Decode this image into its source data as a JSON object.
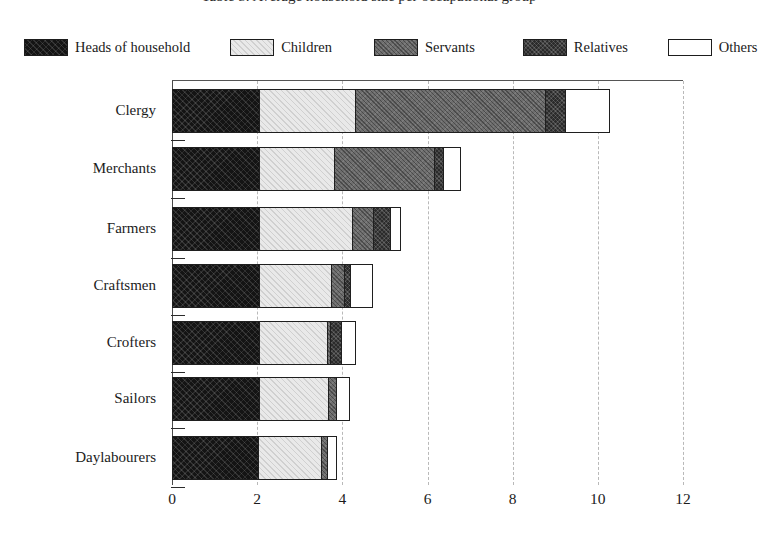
{
  "title": {
    "text": "Table 5. Average household size per occupational group",
    "clipped": true
  },
  "legend": {
    "position": "top",
    "items": [
      {
        "label": "Heads of household",
        "icon": "legend-swatch-black-hatched",
        "fill": "#141414"
      },
      {
        "label": "Children",
        "icon": "legend-swatch-light-hatched",
        "fill": "#e9e9e9"
      },
      {
        "label": "Servants",
        "icon": "legend-swatch-gray-hatched",
        "fill": "#6e6e6e"
      },
      {
        "label": "Relatives",
        "icon": "legend-swatch-dark-hatched",
        "fill": "#2b2b2b"
      },
      {
        "label": "Others",
        "icon": "legend-swatch-white-outline",
        "fill": "#ffffff"
      }
    ]
  },
  "axes": {
    "x": {
      "ticks": [
        "0",
        "2",
        "4",
        "6",
        "8",
        "10",
        "12"
      ],
      "min": 0,
      "max": 12,
      "label": "",
      "grid": true
    },
    "y": {
      "label": "",
      "categories": [
        "Clergy",
        "Merchants",
        "Farmers",
        "Craftsmen",
        "Crofters",
        "Sailors",
        "Daylabourers"
      ]
    }
  },
  "chart_data": {
    "type": "bar",
    "orientation": "horizontal",
    "stacked": true,
    "title": "Table 5. Average household size per occupational group",
    "xlabel": "",
    "ylabel": "",
    "xlim": [
      0,
      12
    ],
    "xticks": [
      0,
      2,
      4,
      6,
      8,
      10,
      12
    ],
    "grid": true,
    "legend_position": "top",
    "categories": [
      "Clergy",
      "Merchants",
      "Farmers",
      "Craftsmen",
      "Crofters",
      "Sailors",
      "Daylabourers"
    ],
    "series": [
      {
        "name": "Heads of household",
        "values": [
          2.05,
          2.05,
          2.05,
          2.05,
          2.05,
          2.05,
          2.02
        ]
      },
      {
        "name": "Children",
        "values": [
          2.25,
          1.76,
          2.17,
          1.69,
          1.6,
          1.62,
          1.48
        ]
      },
      {
        "name": "Servants",
        "values": [
          4.45,
          2.35,
          0.49,
          0.3,
          0.07,
          0.19,
          0.14
        ]
      },
      {
        "name": "Relatives",
        "values": [
          0.47,
          0.21,
          0.4,
          0.14,
          0.26,
          0.0,
          0.0
        ]
      },
      {
        "name": "Others",
        "values": [
          1.06,
          0.41,
          0.26,
          0.54,
          0.34,
          0.33,
          0.24
        ]
      }
    ],
    "totals": [
      10.28,
      6.78,
      5.37,
      4.72,
      4.32,
      4.19,
      3.88
    ]
  }
}
